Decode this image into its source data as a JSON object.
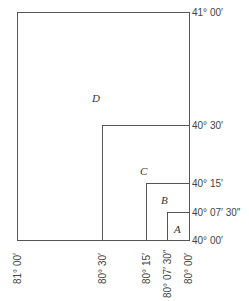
{
  "latitude_labels": [
    "41° 00′",
    "40° 30′",
    "40° 15′",
    "40° 07′ 30″",
    "40° 00′"
  ],
  "longitude_labels": [
    "81° 00′",
    "80° 30′",
    "80° 15′",
    "80° 07′ 30″",
    "80° 00′"
  ],
  "regions": [
    "D",
    "C",
    "B",
    "A"
  ]
}
